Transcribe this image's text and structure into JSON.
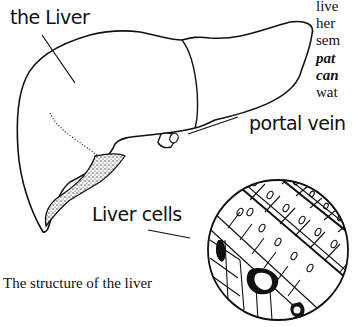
{
  "labels": {
    "liver": "the Liver",
    "portal_vein": "portal vein",
    "liver_cells": "Liver cells"
  },
  "caption": "The structure of the liver",
  "side_text_fragments": [
    {
      "text": "live",
      "style": "normal"
    },
    {
      "text": "her",
      "style": "normal"
    },
    {
      "text": "sem",
      "style": "normal"
    },
    {
      "text": "pat",
      "style": "bold-italic"
    },
    {
      "text": "can",
      "style": "bold-italic"
    },
    {
      "text": "wat",
      "style": "normal"
    }
  ],
  "colors": {
    "ink": "#111111",
    "background": "#ffffff"
  }
}
